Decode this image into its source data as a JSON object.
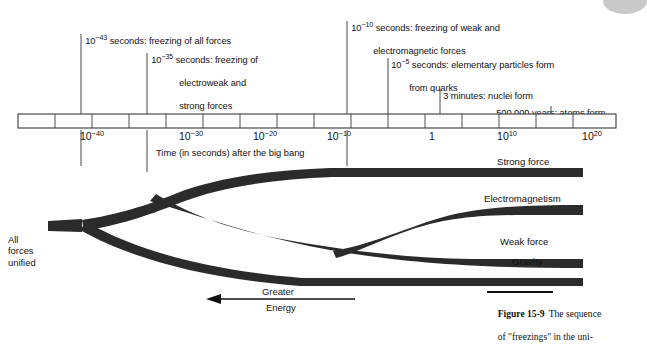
{
  "figure": {
    "number": "Figure 15-9",
    "caption_line1": "The sequence",
    "caption_line2": "of \"freezings\" in the uni-"
  },
  "timeline": {
    "axis_caption": "Time (in seconds) after the big bang",
    "tick_labels": [
      "10-40",
      "10-30",
      "10-20",
      "10-10",
      "1",
      "1010",
      "1020"
    ],
    "ticks": [
      {
        "base": "10",
        "exp": "−40",
        "x": 104
      },
      {
        "base": "10",
        "exp": "−30",
        "x": 203
      },
      {
        "base": "10",
        "exp": "−20",
        "x": 277
      },
      {
        "base": "10",
        "exp": "−10",
        "x": 351
      },
      {
        "base": "1",
        "exp": "",
        "x": 432
      },
      {
        "base": "10",
        "exp": "10",
        "x": 505
      },
      {
        "base": "10",
        "exp": "20",
        "x": 585
      }
    ]
  },
  "events": [
    {
      "id": "freezing-all-forces",
      "exp_base": "10",
      "exponent": "−43",
      "lines": [
        "seconds: freezing of all forces"
      ],
      "leader_x": 81
    },
    {
      "id": "freezing-electroweak-strong",
      "exp_base": "10",
      "exponent": "−35",
      "lines": [
        "seconds: freezing of",
        "electroweak and",
        "strong forces"
      ],
      "leader_x": 147
    },
    {
      "id": "freezing-weak-electromagnetic",
      "exp_base": "10",
      "exponent": "−10",
      "lines": [
        "seconds: freezing of weak and",
        "electromagnetic forces"
      ],
      "leader_x": 347
    },
    {
      "id": "elementary-particles-form",
      "exp_base": "10",
      "exponent": "−5",
      "lines": [
        "seconds: elementary particles form",
        "from quarks"
      ],
      "leader_x": 388
    },
    {
      "id": "nuclei-form",
      "exp_base": "",
      "exponent": "",
      "lines": [
        "3 minutes: nuclei form"
      ],
      "leader_x": 440
    },
    {
      "id": "atoms-form",
      "exp_base": "",
      "exponent": "",
      "lines": [
        "500,000 years: atoms form"
      ],
      "leader_x": 551
    }
  ],
  "branches": {
    "origin_label": "All\nforces\nunified",
    "forces": [
      {
        "id": "strong-force",
        "label": "Strong force"
      },
      {
        "id": "electromagnetism",
        "label": "Electromagnetism"
      },
      {
        "id": "weak-force",
        "label": "Weak force"
      },
      {
        "id": "gravity",
        "label": "Gravity"
      }
    ]
  },
  "energy_arrow": {
    "label_top": "Greater",
    "label_bottom": "Energy",
    "direction": "left"
  },
  "colors": {
    "ink": "#111111",
    "branch": "#2b2b2b",
    "axis_stroke": "#444444",
    "page": "#ffffff"
  }
}
